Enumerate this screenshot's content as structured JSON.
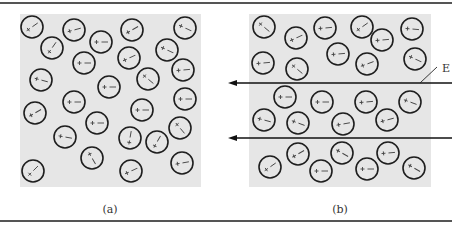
{
  "figure": {
    "width": 468,
    "height": 227,
    "rules": [
      {
        "y": 3,
        "x1": 0,
        "x2": 452
      },
      {
        "y": 221,
        "x1": 0,
        "x2": 452
      }
    ],
    "colors": {
      "panel_bg": "#e6e6e6",
      "circle_stroke": "#1e1e1e",
      "field": "#111111",
      "rule": "#555555"
    },
    "molecule_radius": 11
  },
  "panels": [
    {
      "id": "a",
      "label": "(a)",
      "label_pos": {
        "x": 110,
        "y": 213
      },
      "rect": {
        "x": 20,
        "y": 14,
        "w": 181,
        "h": 173
      },
      "description": "Randomly oriented polar molecules, no applied field",
      "molecules": [
        {
          "x": 32,
          "y": 27,
          "angle": -35
        },
        {
          "x": 74,
          "y": 30,
          "angle": -15
        },
        {
          "x": 132,
          "y": 30,
          "angle": -30
        },
        {
          "x": 185,
          "y": 28,
          "angle": 25
        },
        {
          "x": 52,
          "y": 48,
          "angle": -55
        },
        {
          "x": 101,
          "y": 42,
          "angle": 0
        },
        {
          "x": 129,
          "y": 58,
          "angle": -25
        },
        {
          "x": 167,
          "y": 50,
          "angle": 25
        },
        {
          "x": 84,
          "y": 63,
          "angle": 0
        },
        {
          "x": 183,
          "y": 70,
          "angle": -5
        },
        {
          "x": 41,
          "y": 80,
          "angle": 15
        },
        {
          "x": 109,
          "y": 87,
          "angle": 0
        },
        {
          "x": 148,
          "y": 79,
          "angle": 40
        },
        {
          "x": 74,
          "y": 102,
          "angle": 0
        },
        {
          "x": 185,
          "y": 99,
          "angle": 0
        },
        {
          "x": 35,
          "y": 113,
          "angle": -30
        },
        {
          "x": 142,
          "y": 110,
          "angle": 0
        },
        {
          "x": 97,
          "y": 123,
          "angle": 0
        },
        {
          "x": 180,
          "y": 128,
          "angle": 50
        },
        {
          "x": 65,
          "y": 137,
          "angle": 10
        },
        {
          "x": 130,
          "y": 138,
          "angle": -80
        },
        {
          "x": 157,
          "y": 142,
          "angle": -60
        },
        {
          "x": 92,
          "y": 158,
          "angle": 60
        },
        {
          "x": 33,
          "y": 171,
          "angle": -45
        },
        {
          "x": 131,
          "y": 171,
          "angle": -25
        },
        {
          "x": 182,
          "y": 163,
          "angle": -10
        }
      ]
    },
    {
      "id": "b",
      "label": "(b)",
      "label_pos": {
        "x": 340,
        "y": 213
      },
      "rect": {
        "x": 249,
        "y": 14,
        "w": 182,
        "h": 173
      },
      "description": "Polar molecules partially aligned by applied electric field E",
      "molecules": [
        {
          "x": 264,
          "y": 27,
          "angle": 40
        },
        {
          "x": 296,
          "y": 38,
          "angle": -25
        },
        {
          "x": 325,
          "y": 28,
          "angle": -5
        },
        {
          "x": 362,
          "y": 27,
          "angle": -35
        },
        {
          "x": 382,
          "y": 40,
          "angle": -5
        },
        {
          "x": 412,
          "y": 29,
          "angle": 5
        },
        {
          "x": 263,
          "y": 63,
          "angle": -5
        },
        {
          "x": 297,
          "y": 69,
          "angle": 40
        },
        {
          "x": 338,
          "y": 54,
          "angle": -5
        },
        {
          "x": 367,
          "y": 64,
          "angle": -20
        },
        {
          "x": 415,
          "y": 59,
          "angle": 25
        },
        {
          "x": 285,
          "y": 97,
          "angle": 0
        },
        {
          "x": 322,
          "y": 102,
          "angle": 0
        },
        {
          "x": 366,
          "y": 102,
          "angle": -5
        },
        {
          "x": 410,
          "y": 102,
          "angle": 20
        },
        {
          "x": 264,
          "y": 120,
          "angle": 15
        },
        {
          "x": 298,
          "y": 123,
          "angle": 20
        },
        {
          "x": 343,
          "y": 124,
          "angle": -10
        },
        {
          "x": 387,
          "y": 120,
          "angle": -15
        },
        {
          "x": 270,
          "y": 167,
          "angle": -35
        },
        {
          "x": 298,
          "y": 154,
          "angle": -30
        },
        {
          "x": 321,
          "y": 171,
          "angle": 0
        },
        {
          "x": 342,
          "y": 153,
          "angle": 30
        },
        {
          "x": 367,
          "y": 169,
          "angle": 0
        },
        {
          "x": 388,
          "y": 153,
          "angle": -5
        },
        {
          "x": 414,
          "y": 168,
          "angle": 30
        }
      ],
      "field_lines": [
        {
          "y": 83,
          "x_tail": 452,
          "x_head": 228
        },
        {
          "y": 138,
          "x_tail": 452,
          "x_head": 228
        }
      ],
      "field_label": {
        "text": "E",
        "x": 442,
        "y": 72,
        "leader": {
          "x1": 420,
          "y1": 83,
          "x2": 437,
          "y2": 67
        }
      }
    }
  ],
  "dipole_symbols": {
    "positive": "+",
    "negative": "−"
  }
}
